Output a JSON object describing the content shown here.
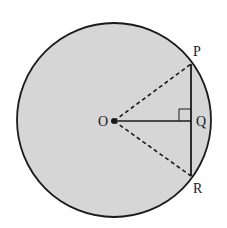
{
  "diagram": {
    "title": "",
    "fill_color": "#d6d6d6",
    "stroke_color": "#1a1a1a",
    "labels": {
      "O": "O",
      "P": "P",
      "Q": "Q",
      "R": "R"
    }
  }
}
